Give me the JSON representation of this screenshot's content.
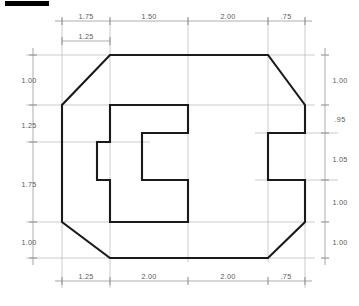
{
  "drawing": {
    "type": "orthographic-engineering-drawing",
    "description": "Front view of a chamfered octagonal plate with a C-shaped internal notch, fully dimensioned",
    "units": "inches",
    "line_colors": {
      "object_line": "#1a1a1a",
      "dimension_line": "#9a9a9a",
      "extension_line": "#b4b4b4",
      "text": "#58585a",
      "corner_marker": "#000000"
    },
    "corner_marker": {
      "name": "top-left-black-bar",
      "visible": true
    },
    "dimensions": {
      "top_chain": [
        {
          "label": "1.75",
          "x1": 62,
          "x2": 110
        },
        {
          "label": "1.50",
          "x1": 110,
          "x2": 188
        },
        {
          "label": "2.00",
          "x1": 188,
          "x2": 268
        },
        {
          "label": ".75",
          "x1": 268,
          "x2": 305
        }
      ],
      "top_secondary": [
        {
          "label": "1.25",
          "x1": 62,
          "x2": 110
        }
      ],
      "bottom_chain": [
        {
          "label": "1.25",
          "x1": 62,
          "x2": 110
        },
        {
          "label": "2.00",
          "x1": 110,
          "x2": 188
        },
        {
          "label": "2.00",
          "x1": 188,
          "x2": 268
        },
        {
          "label": ".75",
          "x1": 268,
          "x2": 305
        }
      ],
      "left_chain": [
        {
          "label": "1.00",
          "y1": 55,
          "y2": 105
        },
        {
          "label": "1.25",
          "y1": 105,
          "y2": 142
        },
        {
          "label": "1.75",
          "y1": 142,
          "y2": 222
        },
        {
          "label": "1.00",
          "y1": 222,
          "y2": 258
        }
      ],
      "right_chain": [
        {
          "label": "1.00",
          "y1": 55,
          "y2": 105
        },
        {
          "label": ".95",
          "y1": 105,
          "y2": 133
        },
        {
          "label": "1.05",
          "y1": 133,
          "y2": 180
        },
        {
          "label": "1.00",
          "y1": 180,
          "y2": 222
        },
        {
          "label": "1.00",
          "y1": 222,
          "y2": 258
        }
      ]
    },
    "outer_profile": {
      "name": "plate-outline",
      "points": "110,55 268,55 305,105 305,133 268,133 268,180 305,180 305,222 268,258 110,258 62,222 62,105"
    },
    "inner_notch": {
      "name": "internal-notch",
      "points": "110,105 188,105 188,133 142,133 142,180 188,180 188,222 110,222 110,180 97,180 97,142 110,142"
    }
  }
}
